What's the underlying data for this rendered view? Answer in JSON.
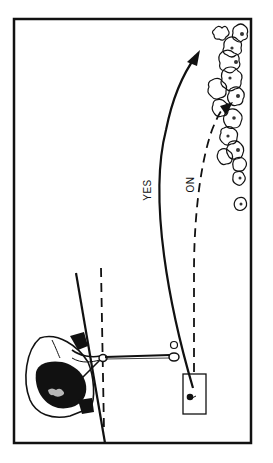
{
  "diagram": {
    "labels": {
      "yes": "YES",
      "no": "NO"
    },
    "paths": [
      {
        "id": "yes-path",
        "style": "solid",
        "label_ref": "yes",
        "meaning": "correct ball flight curving away from trees"
      },
      {
        "id": "no-path",
        "style": "dashed",
        "label_ref": "no",
        "meaning": "incorrect ball flight into trees"
      }
    ],
    "colors": {
      "ink": "#111111",
      "background": "#ffffff"
    }
  }
}
